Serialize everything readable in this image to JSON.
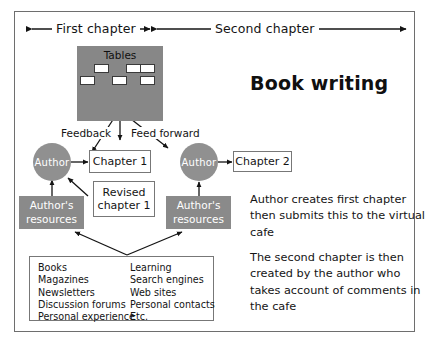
{
  "diagram": {
    "title": "Book writing",
    "top_spans": [
      {
        "label": "First chapter"
      },
      {
        "label": "Second chapter"
      }
    ],
    "tables": {
      "label": "Tables"
    },
    "flow_labels": [
      {
        "label": "Feedback"
      },
      {
        "label": "Feed forward"
      }
    ],
    "nodes": {
      "author_left": "Author",
      "author_right": "Author",
      "chapter_1": "Chapter 1",
      "revised_chapter_1": "Revised\nchapter 1",
      "revised_chapter_1_line1": "Revised",
      "revised_chapter_1_line2": "chapter 1",
      "chapter_2": "Chapter 2",
      "resources_left_line1": "Author's",
      "resources_left_line2": "resources",
      "resources_right_line1": "Author's",
      "resources_right_line2": "resources"
    },
    "resource_list": {
      "column_a": [
        "Books",
        "Magazines",
        "Newsletters",
        "Discussion forums",
        "Personal experience"
      ],
      "column_b": [
        "Learning",
        "Search engines",
        "Web sites",
        "Personal contacts",
        "Etc."
      ]
    },
    "notes": [
      "Author creates first chapter then submits this to the virtual cafe",
      "The second chapter is then created by the author who takes account of comments in the cafe"
    ],
    "colors": {
      "gray_fill": "#878787",
      "box_fill": "#8a8a8a",
      "circle_fill": "#909090",
      "frame_border": "#6e6e6e",
      "text": "#141414"
    }
  }
}
